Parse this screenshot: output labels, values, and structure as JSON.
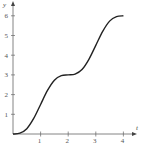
{
  "chart_data": {
    "type": "line",
    "title": "",
    "xlabel": "t",
    "ylabel": "y",
    "xlim": [
      0,
      4.4
    ],
    "ylim": [
      0,
      6.5
    ],
    "x_ticks": [
      1,
      2,
      3,
      4
    ],
    "y_ticks": [
      1,
      2,
      3,
      4,
      5,
      6
    ],
    "x_tick_labels": [
      "1",
      "2",
      "3",
      "4"
    ],
    "y_tick_labels": [
      "1",
      "2",
      "3",
      "4",
      "5",
      "6"
    ],
    "grid": false,
    "legend": null,
    "series": [
      {
        "name": "y(t)",
        "x": [
          0,
          0.25,
          0.5,
          0.75,
          1,
          1.25,
          1.5,
          1.75,
          2,
          2.25,
          2.5,
          2.75,
          3,
          3.25,
          3.5,
          3.75,
          4
        ],
        "values": [
          0,
          0.04,
          0.27,
          0.79,
          1.5,
          2.21,
          2.73,
          2.96,
          3,
          3.04,
          3.27,
          3.79,
          4.5,
          5.21,
          5.73,
          5.96,
          6
        ],
        "color": "#222222"
      }
    ]
  },
  "axes": {
    "x_label": "t",
    "y_label": "y"
  }
}
